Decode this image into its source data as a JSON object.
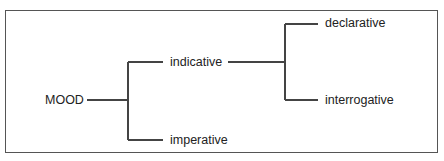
{
  "diagram": {
    "type": "system-network",
    "colors": {
      "line": "#444444",
      "text": "#222222",
      "border": "#555555",
      "background": "#ffffff"
    },
    "root": {
      "label": "MOOD"
    },
    "level1": [
      {
        "label": "indicative"
      },
      {
        "label": "imperative"
      }
    ],
    "level2": [
      {
        "label": "declarative",
        "parent": "indicative"
      },
      {
        "label": "interrogative",
        "parent": "indicative"
      }
    ]
  }
}
